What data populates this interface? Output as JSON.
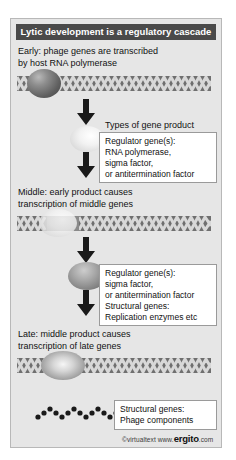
{
  "figure": {
    "title": "Lytic development is a regulatory cascade",
    "stages": {
      "early": {
        "line1": "Early: phage genes are transcribed",
        "line2": "by host RNA polymerase"
      },
      "middle": {
        "line1": "Middle: early product causes",
        "line2": "transcription of middle genes"
      },
      "late": {
        "line1": "Late: middle product causes",
        "line2": "transcription of late genes"
      }
    },
    "products_header": "Types of gene product",
    "boxes": {
      "early_product": {
        "line1": "Regulator gene(s):",
        "line2": "RNA polymerase,",
        "line3": "sigma factor,",
        "line4": "or antitermination factor"
      },
      "middle_product": {
        "line1": "Regulator gene(s):",
        "line2": "sigma factor,",
        "line3": "or antitermination factor",
        "line4": "Structural genes:",
        "line5": "Replication enzymes etc"
      },
      "late_product": {
        "line1": "Structural genes:",
        "line2": "Phage components"
      }
    },
    "footer": {
      "copyright": "©virtualtext",
      "www": "www.",
      "brand": "ergito",
      "dotcom": ".com"
    },
    "colors": {
      "panel_background": "#e6e6e6",
      "title_bar": "#4a4a4a",
      "title_text": "#ffffff",
      "dna_strand": "#6f6f6f",
      "arrow": "#1a1a1a",
      "box_background": "#ffffff",
      "box_border": "#9a9a9a",
      "body_text": "#111111"
    }
  }
}
